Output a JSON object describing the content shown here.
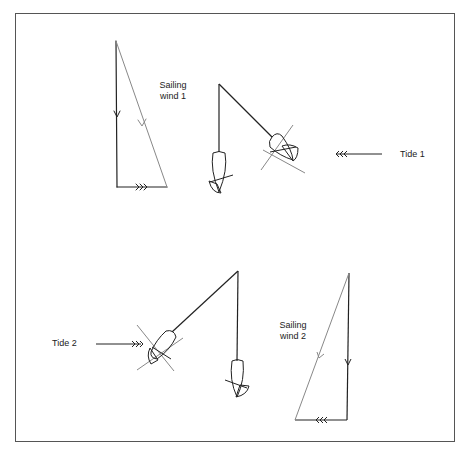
{
  "diagram": {
    "labels": {
      "sailing_wind_1_line1": "Sailing",
      "sailing_wind_1_line2": "wind 1",
      "tide_1": "Tide 1",
      "sailing_wind_2_line1": "Sailing",
      "sailing_wind_2_line2": "wind 2",
      "tide_2": "Tide 2"
    },
    "colors": {
      "line": "#222222",
      "grey_line": "#888888",
      "frame": "#555555"
    },
    "groups": [
      {
        "name": "scenario-1",
        "vector_triangle": {
          "top": [
            116,
            41
          ],
          "bottom_left": [
            117,
            187
          ],
          "bottom_right": [
            167,
            187
          ]
        },
        "anchor_point": [
          219,
          84
        ],
        "boat_straight_down": [
          219,
          172
        ],
        "boat_angled": [
          280,
          148
        ],
        "tide_arrow": {
          "from": [
            410,
            154
          ],
          "to": [
            335,
            154
          ],
          "direction": "left"
        }
      },
      {
        "name": "scenario-2",
        "vector_triangle": {
          "top": [
            349,
            273
          ],
          "bottom_right": [
            347,
            420
          ],
          "bottom_left": [
            295,
            420
          ]
        },
        "anchor_point": [
          238,
          271
        ],
        "boat_straight_down": [
          237,
          380
        ],
        "boat_angled": [
          160,
          345
        ],
        "tide_arrow": {
          "from": [
            95,
            344
          ],
          "to": [
            140,
            344
          ],
          "direction": "right"
        }
      }
    ]
  }
}
